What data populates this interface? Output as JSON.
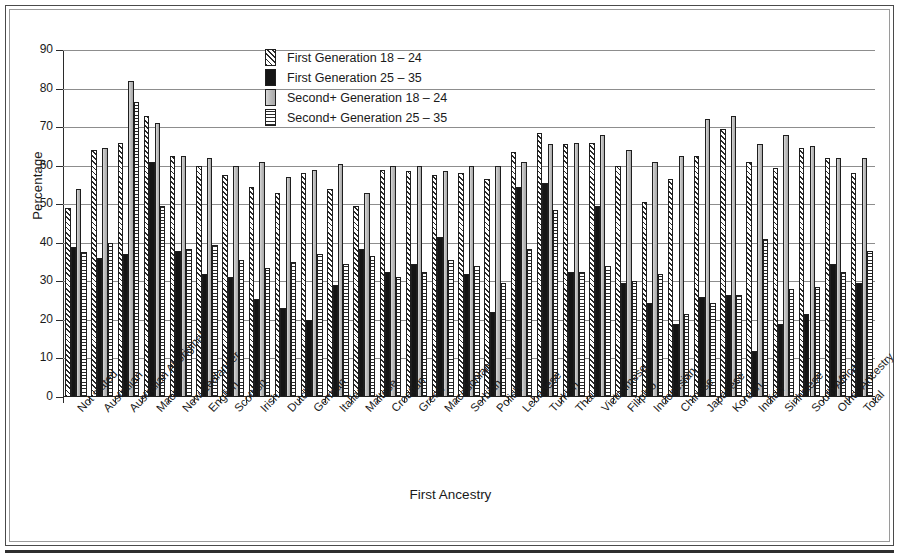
{
  "chart_data": {
    "type": "bar",
    "title": "",
    "xlabel": "First Ancestry",
    "ylabel": "Percentage",
    "ylim": [
      0,
      90
    ],
    "ytick_step": 10,
    "yticks": [
      0,
      10,
      20,
      30,
      40,
      50,
      60,
      70,
      80,
      90
    ],
    "grid": true,
    "legend_position": "top-center",
    "categories": [
      "Not stated",
      "Australian",
      "Australian Aboriginal",
      "Maori",
      "New Zealander",
      "English",
      "Scottish",
      "Irish",
      "Dutch",
      "German",
      "Italian",
      "Maltese",
      "Croatian",
      "Greek",
      "Macedonian",
      "Serbian",
      "Polish",
      "Lebanese",
      "Turkish",
      "Thai",
      "Vietnamese",
      "Filipino",
      "Indonesian",
      "Chinese",
      "Japanese",
      "Korean",
      "Indian",
      "Sinhalese",
      "South African",
      "Other Ancestry",
      "Total"
    ],
    "series": [
      {
        "name": "First Generation 18 – 24",
        "key": "first_gen_18_24",
        "values": [
          49,
          64,
          66,
          73,
          62.5,
          60,
          57.5,
          54.5,
          53,
          58,
          54,
          49.5,
          59,
          58.5,
          57.5,
          58,
          56.5,
          63.5,
          68.5,
          65.5,
          66,
          60,
          50.5,
          56.5,
          62.5,
          69.5,
          61,
          59.5,
          64.5,
          62,
          58
        ]
      },
      {
        "name": "First Generation 25 – 35",
        "key": "first_gen_25_35",
        "values": [
          39,
          36,
          37,
          61,
          38,
          32,
          31,
          25.5,
          23,
          20,
          29,
          38.5,
          32.5,
          34.5,
          41.5,
          32,
          22,
          54.5,
          55.5,
          32.5,
          49.5,
          29.5,
          24.5,
          19,
          26,
          26.5,
          12,
          19,
          21.5,
          34.5,
          29.5
        ]
      },
      {
        "name": "Second+ Generation 18 – 24",
        "key": "second_gen_18_24",
        "values": [
          54,
          64.5,
          82,
          71,
          62.5,
          62,
          60,
          61,
          57,
          59,
          60.5,
          53,
          60,
          60,
          58.5,
          60,
          60,
          61,
          65.5,
          66,
          68,
          64,
          61,
          62.5,
          72,
          73,
          65.5,
          68,
          65,
          62,
          62
        ]
      },
      {
        "name": "Second+ Generation 25 – 35",
        "key": "second_gen_25_35",
        "values": [
          37.5,
          40,
          76.5,
          49.5,
          38.5,
          39.5,
          35.5,
          33.5,
          35,
          37,
          34.5,
          36.5,
          31,
          32.5,
          35.5,
          34,
          29.5,
          38.5,
          48.5,
          32.5,
          34,
          30,
          32,
          21.5,
          24.5,
          26.5,
          41,
          28,
          28.5,
          32.5,
          38
        ]
      }
    ]
  },
  "legend": {
    "items": [
      {
        "label": "First Generation 18 – 24",
        "swatch": "diagonal-hatch"
      },
      {
        "label": "First Generation 25 – 35",
        "swatch": "solid-black"
      },
      {
        "label": "Second+ Generation 18 – 24",
        "swatch": "solid-grey"
      },
      {
        "label": "Second+ Generation 25 – 35",
        "swatch": "horizontal-lines"
      }
    ]
  },
  "axes": {
    "y_title": "Percentage",
    "x_title": "First Ancestry"
  }
}
